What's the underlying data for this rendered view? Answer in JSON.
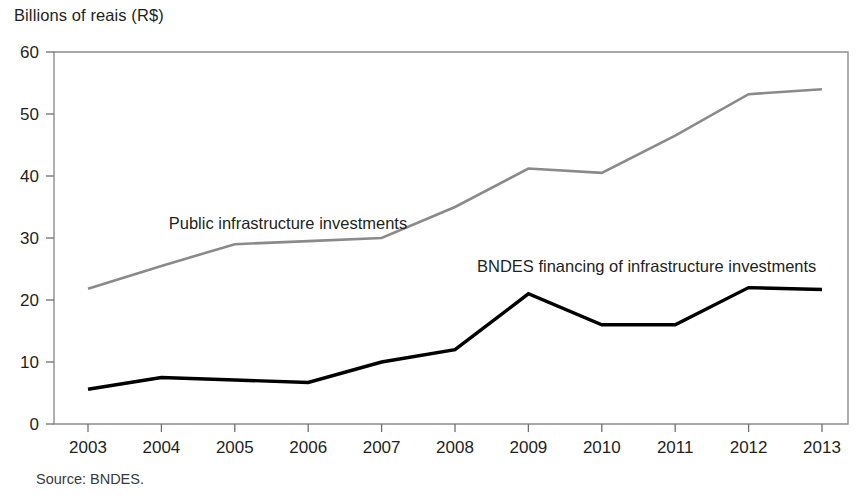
{
  "figure": {
    "axis_title": "Billions of reais (R$)",
    "source_note": "Source: BNDES."
  },
  "chart_data": {
    "type": "line",
    "title": "",
    "subtitle": "",
    "xlabel": "",
    "ylabel": "Billions of reais (R$)",
    "categories": [
      "2003",
      "2004",
      "2005",
      "2006",
      "2007",
      "2008",
      "2009",
      "2010",
      "2011",
      "2012",
      "2013"
    ],
    "x": [
      2003,
      2004,
      2005,
      2006,
      2007,
      2008,
      2009,
      2010,
      2011,
      2012,
      2013
    ],
    "ylim": [
      0,
      60
    ],
    "yticks": [
      0,
      10,
      20,
      30,
      40,
      50,
      60
    ],
    "ytick_labels": [
      "0",
      "10",
      "20",
      "30",
      "40",
      "50",
      "60"
    ],
    "grid": false,
    "legend_position": "inline-annotation",
    "series": [
      {
        "name": "Public infrastructure investments",
        "color": "#8a8a8a",
        "values": [
          21.8,
          25.5,
          29.0,
          29.5,
          30.0,
          35.0,
          41.2,
          40.5,
          46.5,
          53.2,
          54.0
        ],
        "label_x": 2004.1,
        "label_y": 31.5
      },
      {
        "name": "BNDES financing of infrastructure investments",
        "color": "#000000",
        "values": [
          5.6,
          7.5,
          7.1,
          6.7,
          10.0,
          12.0,
          21.0,
          16.0,
          16.0,
          22.0,
          21.7
        ],
        "label_x": 2008.3,
        "label_y": 24.5
      }
    ],
    "annotations": [
      {
        "text": "Public infrastructure investments",
        "series": "Public infrastructure investments"
      },
      {
        "text": "BNDES financing of infrastructure investments",
        "series": "BNDES financing of infrastructure investments"
      }
    ]
  },
  "colors": {
    "background": "#ffffff",
    "frame": "#8c8c8c",
    "text": "#231f20",
    "series_gray": "#8a8a8a",
    "series_black": "#000000"
  }
}
